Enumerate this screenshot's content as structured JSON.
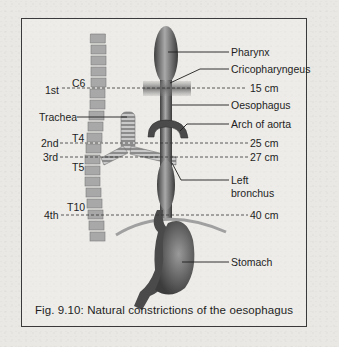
{
  "figure": {
    "caption": "Fig. 9.10: Natural constrictions of the oesophagus"
  },
  "labels": {
    "right": {
      "pharynx": "Pharynx",
      "cricopharyngeus": "Cricopharyngeus",
      "oesophagus": "Oesophagus",
      "arch_of_aorta": "Arch of aorta",
      "left_bronchus_line1": "Left",
      "left_bronchus_line2": "bronchus",
      "stomach": "Stomach"
    },
    "left": {
      "trachea": "Trachea"
    }
  },
  "constrictions": [
    {
      "ordinal": "1st",
      "vertebra": "C6",
      "distance": "15 cm"
    },
    {
      "ordinal": "2nd",
      "vertebra": "T4",
      "distance": "25 cm"
    },
    {
      "ordinal": "3rd",
      "vertebra": "T5",
      "distance": "27 cm"
    },
    {
      "ordinal": "4th",
      "vertebra": "T10",
      "distance": "40 cm"
    }
  ],
  "colors": {
    "frame": "#3a3a3a",
    "organ_dark": "#4a4a4a",
    "organ_light": "#9a9a9a",
    "vertebra": "#a8a8a8",
    "text": "#1e1e1e"
  }
}
